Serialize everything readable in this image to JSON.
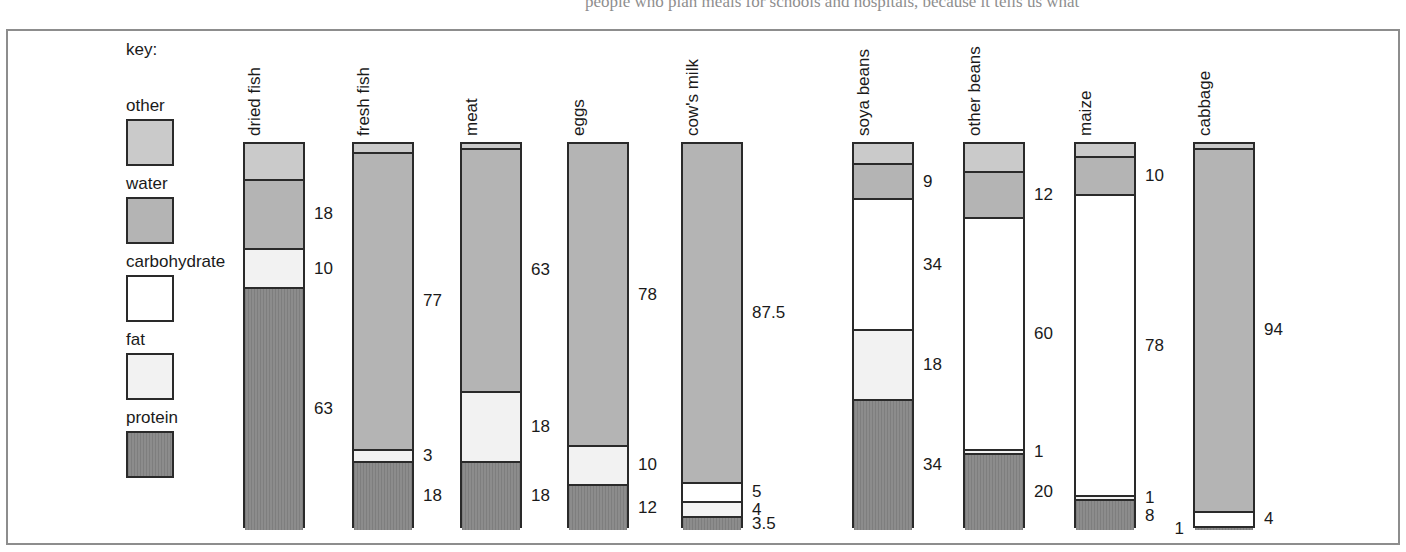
{
  "page": {
    "top_text_left": "",
    "top_text_right": "people who plan meals for schools and hospitals, because it tells us what"
  },
  "legend": {
    "title": "key:",
    "entries": [
      {
        "label": "other",
        "key": "other",
        "color": "#cacaca"
      },
      {
        "label": "water",
        "key": "water",
        "color": "#b4b4b4"
      },
      {
        "label": "carbohydrate",
        "key": "carbohydrate",
        "color": "#ffffff"
      },
      {
        "label": "fat",
        "key": "fat",
        "color": "#f2f2f2"
      },
      {
        "label": "protein",
        "key": "protein",
        "color": "#8c8c8c"
      }
    ]
  },
  "chart_data": {
    "type": "bar",
    "subtype": "stacked-vertical-100percent",
    "title": "",
    "xlabel": "",
    "ylabel": "",
    "ylim": [
      0,
      100
    ],
    "units": "percent",
    "grid": false,
    "legend_position": "left",
    "categories": [
      "dried fish",
      "fresh fish",
      "meat",
      "eggs",
      "cow's milk",
      "soya beans",
      "other beans",
      "maize",
      "cabbage"
    ],
    "series": [
      {
        "name": "other",
        "values": [
          9,
          2,
          1,
          0,
          0,
          5,
          7,
          3,
          1
        ]
      },
      {
        "name": "water",
        "values": [
          18,
          77,
          63,
          78,
          87.5,
          9,
          12,
          10,
          94
        ]
      },
      {
        "name": "carbohydrate",
        "values": [
          0,
          0,
          0,
          0,
          5,
          34,
          60,
          78,
          4
        ]
      },
      {
        "name": "fat",
        "values": [
          10,
          3,
          18,
          10,
          4,
          18,
          1,
          1,
          0
        ]
      },
      {
        "name": "protein",
        "values": [
          63,
          18,
          18,
          12,
          3.5,
          34,
          20,
          8,
          1
        ]
      }
    ],
    "bars": [
      {
        "name": "dried fish",
        "segments": [
          {
            "key": "other",
            "value": 9,
            "label": ""
          },
          {
            "key": "water",
            "value": 18,
            "label": "18"
          },
          {
            "key": "fat",
            "value": 10,
            "label": "10"
          },
          {
            "key": "protein",
            "value": 63,
            "label": "63"
          }
        ]
      },
      {
        "name": "fresh fish",
        "segments": [
          {
            "key": "other",
            "value": 2,
            "label": ""
          },
          {
            "key": "water",
            "value": 77,
            "label": "77"
          },
          {
            "key": "fat",
            "value": 3,
            "label": "3"
          },
          {
            "key": "protein",
            "value": 18,
            "label": "18"
          }
        ]
      },
      {
        "name": "meat",
        "segments": [
          {
            "key": "other",
            "value": 1,
            "label": ""
          },
          {
            "key": "water",
            "value": 63,
            "label": "63"
          },
          {
            "key": "fat",
            "value": 18,
            "label": "18"
          },
          {
            "key": "protein",
            "value": 18,
            "label": "18"
          }
        ]
      },
      {
        "name": "eggs",
        "segments": [
          {
            "key": "water",
            "value": 78,
            "label": "78"
          },
          {
            "key": "fat",
            "value": 10,
            "label": "10"
          },
          {
            "key": "protein",
            "value": 12,
            "label": "12"
          }
        ]
      },
      {
        "name": "cow's milk",
        "segments": [
          {
            "key": "water",
            "value": 87.5,
            "label": "87.5"
          },
          {
            "key": "carbohydrate",
            "value": 5,
            "label": "5"
          },
          {
            "key": "fat",
            "value": 4,
            "label": "4"
          },
          {
            "key": "protein",
            "value": 3.5,
            "label": "3.5"
          }
        ]
      },
      {
        "name": "soya beans",
        "segments": [
          {
            "key": "other",
            "value": 5,
            "label": ""
          },
          {
            "key": "water",
            "value": 9,
            "label": "9"
          },
          {
            "key": "carbohydrate",
            "value": 34,
            "label": "34"
          },
          {
            "key": "fat",
            "value": 18,
            "label": "18"
          },
          {
            "key": "protein",
            "value": 34,
            "label": "34"
          }
        ]
      },
      {
        "name": "other beans",
        "segments": [
          {
            "key": "other",
            "value": 7,
            "label": ""
          },
          {
            "key": "water",
            "value": 12,
            "label": "12"
          },
          {
            "key": "carbohydrate",
            "value": 60,
            "label": "60"
          },
          {
            "key": "fat",
            "value": 1,
            "label": "1"
          },
          {
            "key": "protein",
            "value": 20,
            "label": "20"
          }
        ]
      },
      {
        "name": "maize",
        "segments": [
          {
            "key": "other",
            "value": 3,
            "label": ""
          },
          {
            "key": "water",
            "value": 10,
            "label": "10"
          },
          {
            "key": "carbohydrate",
            "value": 78,
            "label": "78"
          },
          {
            "key": "fat",
            "value": 1,
            "label": "1"
          },
          {
            "key": "protein",
            "value": 8,
            "label": "8"
          }
        ]
      },
      {
        "name": "cabbage",
        "segments": [
          {
            "key": "other",
            "value": 1,
            "label": ""
          },
          {
            "key": "water",
            "value": 94,
            "label": "94"
          },
          {
            "key": "carbohydrate",
            "value": 4,
            "label": "4"
          },
          {
            "key": "protein",
            "value": 1,
            "label": "1",
            "side": "left"
          }
        ]
      }
    ]
  },
  "layout": {
    "bar_left_positions": [
      243,
      352,
      460,
      567,
      681,
      852,
      963,
      1074,
      1193
    ],
    "bar_width": 62,
    "bar_area_height": 386
  }
}
